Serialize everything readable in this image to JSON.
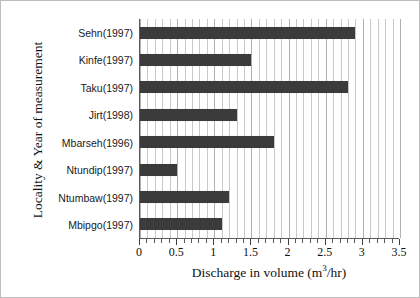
{
  "chart_data": {
    "type": "bar",
    "orientation": "horizontal",
    "title": "",
    "xlabel": "Discharge in volume (m³/hr)",
    "ylabel": "Locality & Year of measurement",
    "categories": [
      "Sehn(1997)",
      "Kinfe(1997)",
      "Taku(1997)",
      "Jirt(1998)",
      "Mbarseh(1996)",
      "Ntundip(1997)",
      "Ntumbaw(1997)",
      "Mbipgo(1997)"
    ],
    "values": [
      2.9,
      1.5,
      2.8,
      1.3,
      1.8,
      0.5,
      1.2,
      1.1
    ],
    "xlim": [
      0,
      3.5
    ],
    "xticks": [
      0,
      0.5,
      1,
      1.5,
      2,
      2.5,
      3,
      3.5
    ],
    "xtick_labels": [
      "0",
      "0.5",
      "1",
      "1.5",
      "2",
      "2.5",
      "3",
      "3.5"
    ],
    "minor_tick_step": 0.1,
    "grid": true,
    "grid_axis": "x",
    "legend": false,
    "bar_color": "#3b3b3b",
    "grid_color": "#c9c9c9",
    "axis_color": "#5a5a5a",
    "background_color": "#ffffff"
  },
  "axis_titles": {
    "x_prefix": "Discharge in volume (m",
    "x_superscript": "3",
    "x_suffix": "/hr)",
    "y": "Locality & Year of measurement"
  }
}
